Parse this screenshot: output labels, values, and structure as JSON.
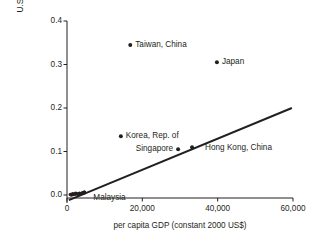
{
  "chart_data": {
    "type": "scatter",
    "title": "",
    "subtitle": "",
    "xlabel": "per capita GDP (constant 2000 US$)",
    "ylabel_line1": "U.S. patents per 1,000 patents",
    "ylabel_line2": "issued by USPTO",
    "xlim": [
      0,
      60000
    ],
    "ylim": [
      0.0,
      0.4
    ],
    "xticks": [
      0,
      20000,
      40000,
      60000
    ],
    "xtick_labels": [
      "0",
      "20,000",
      "40,000",
      "60,000"
    ],
    "yticks": [
      0.0,
      0.1,
      0.2,
      0.3,
      0.4
    ],
    "ytick_labels": [
      "0.0",
      "0.1",
      "0.2",
      "0.3",
      "0.4"
    ],
    "grid": false,
    "legend": "none",
    "marker_color": "#231f20",
    "line_color": "#231f20",
    "axis_color": "#231f20",
    "points": [
      {
        "label": "Taiwan, China",
        "x": 16800,
        "y": 0.345,
        "label_anchor": "start",
        "label_dx": 5,
        "label_dy": 0
      },
      {
        "label": "Japan",
        "x": 39800,
        "y": 0.305,
        "label_anchor": "start",
        "label_dx": 5,
        "label_dy": 0
      },
      {
        "label": "Korea, Rep. of",
        "x": 14300,
        "y": 0.135,
        "label_anchor": "start",
        "label_dx": 5,
        "label_dy": 0
      },
      {
        "label": "Singapore",
        "x": 29500,
        "y": 0.105,
        "label_anchor": "end",
        "label_dx": -5,
        "label_dy": 0
      },
      {
        "label": "Hong Kong, China",
        "x": 33200,
        "y": 0.11,
        "label_anchor": "start",
        "label_dx": 13,
        "label_dy": 1
      },
      {
        "label": "Malaysia",
        "x": 4600,
        "y": 0.006,
        "label_anchor": "start",
        "label_dx": 9,
        "label_dy": 6
      }
    ],
    "cluster_points": [
      {
        "x": 1200,
        "y": 0.0
      },
      {
        "x": 1700,
        "y": 0.001
      },
      {
        "x": 2100,
        "y": 0.002
      },
      {
        "x": 2500,
        "y": 0.003
      },
      {
        "x": 2900,
        "y": 0.002
      },
      {
        "x": 3300,
        "y": 0.004
      },
      {
        "x": 3700,
        "y": 0.003
      },
      {
        "x": 4100,
        "y": 0.005
      },
      {
        "x": 4600,
        "y": 0.006
      },
      {
        "x": 900,
        "y": 0.001
      },
      {
        "x": 1500,
        "y": 0.003
      },
      {
        "x": 2300,
        "y": 0.004
      }
    ],
    "trend_line": {
      "x_start": 500,
      "y_start": -0.012,
      "x_end": 59700,
      "y_end": 0.2
    }
  }
}
